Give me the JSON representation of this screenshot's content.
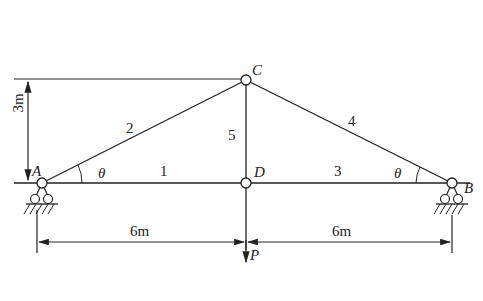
{
  "diagram": {
    "type": "truss",
    "nodes": {
      "A": {
        "label": "A",
        "support": "roller"
      },
      "B": {
        "label": "B",
        "support": "roller"
      },
      "C": {
        "label": "C"
      },
      "D": {
        "label": "D"
      }
    },
    "members": [
      {
        "id": "1",
        "from": "A",
        "to": "D"
      },
      {
        "id": "2",
        "from": "A",
        "to": "C"
      },
      {
        "id": "3",
        "from": "D",
        "to": "B"
      },
      {
        "id": "4",
        "from": "C",
        "to": "B"
      },
      {
        "id": "5",
        "from": "C",
        "to": "D"
      }
    ],
    "angles": {
      "left": "θ",
      "right": "θ"
    },
    "dimensions": {
      "height": "3m",
      "left_span": "6m",
      "right_span": "6m"
    },
    "load": {
      "label": "P",
      "at": "D",
      "direction": "down"
    }
  }
}
